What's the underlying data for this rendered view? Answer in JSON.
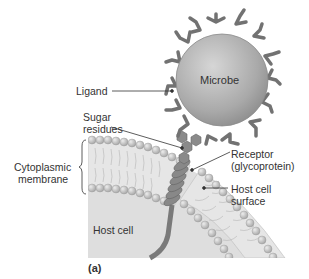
{
  "labels": {
    "microbe": "Microbe",
    "ligand": "Ligand",
    "sugar_line1": "Sugar",
    "sugar_line2": "residues",
    "receptor_line1": "Receptor",
    "receptor_line2": "(glycoprotein)",
    "cyto_line1": "Cytoplasmic",
    "cyto_line2": "membrane",
    "surface_line1": "Host cell",
    "surface_line2": "surface",
    "host_cell": "Host cell",
    "panel": "(a)"
  },
  "colors": {
    "microbe_fill": "#a8a8a8",
    "ligand": "#6e6e6e",
    "membrane_head": "#c4c4c4",
    "cytoplasm": "#dcdcdc",
    "receptor": "#7a7a7a",
    "text": "#333333"
  }
}
